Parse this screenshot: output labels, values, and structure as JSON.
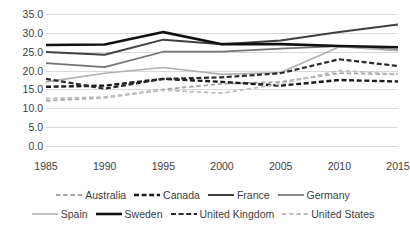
{
  "chart_data": {
    "type": "line",
    "title": "",
    "subtitle": "",
    "xlabel": "",
    "ylabel": "",
    "x": [
      1985,
      1990,
      1995,
      2000,
      2005,
      2010,
      2015
    ],
    "xtick_labels": [
      "1985",
      "1990",
      "1995",
      "2000",
      "2005",
      "2010",
      "2015"
    ],
    "ytick_labels": [
      "0.0",
      "5.0",
      "10.0",
      "15.0",
      "20.0",
      "25.0",
      "30.0",
      "35.0"
    ],
    "ytick_values": [
      0.0,
      5.0,
      10.0,
      15.0,
      20.0,
      25.0,
      30.0,
      35.0
    ],
    "ylim": [
      0.0,
      35.0
    ],
    "grid": "horizontal",
    "legend_position": "bottom",
    "series": [
      {
        "name": "Australia",
        "values": [
          12.0,
          12.8,
          15.0,
          16.5,
          17.0,
          19.3,
          19.0
        ],
        "color": "#a6a6a6",
        "style": "dashed",
        "width": 1.8
      },
      {
        "name": "Canada",
        "values": [
          15.7,
          16.0,
          17.8,
          17.0,
          16.0,
          17.5,
          17.1
        ],
        "color": "#1a1a1a",
        "style": "dashed",
        "width": 2.4
      },
      {
        "name": "France",
        "values": [
          24.9,
          24.2,
          28.2,
          27.0,
          28.0,
          30.2,
          32.2
        ],
        "color": "#404040",
        "style": "solid",
        "width": 2.0
      },
      {
        "name": "Germany",
        "values": [
          22.0,
          20.9,
          25.0,
          25.0,
          25.8,
          26.5,
          25.5
        ],
        "color": "#737373",
        "style": "solid",
        "width": 1.7
      },
      {
        "name": "Spain",
        "values": [
          17.0,
          19.3,
          20.8,
          19.0,
          19.5,
          26.3,
          25.3
        ],
        "color": "#b0b0b0",
        "style": "solid",
        "width": 1.6
      },
      {
        "name": "Sweden",
        "values": [
          26.8,
          26.9,
          30.2,
          27.0,
          27.0,
          26.5,
          26.2
        ],
        "color": "#111111",
        "style": "solid",
        "width": 2.6
      },
      {
        "name": "United Kingdom",
        "values": [
          17.8,
          15.2,
          17.8,
          18.2,
          19.3,
          23.0,
          21.2
        ],
        "color": "#2b2b2b",
        "style": "dashed",
        "width": 2.2
      },
      {
        "name": "United States",
        "values": [
          12.6,
          13.0,
          14.8,
          14.0,
          16.5,
          20.0,
          19.0
        ],
        "color": "#bfbfbf",
        "style": "dashed",
        "width": 1.8
      }
    ]
  },
  "legend": {
    "rows": [
      [
        "Australia",
        "Canada",
        "France",
        "Germany"
      ],
      [
        "Spain",
        "Sweden",
        "United Kingdom",
        "United States"
      ]
    ]
  },
  "colors": {
    "gridline": "#d9d9d9",
    "text": "#3d3d3d",
    "background": "#ffffff"
  }
}
